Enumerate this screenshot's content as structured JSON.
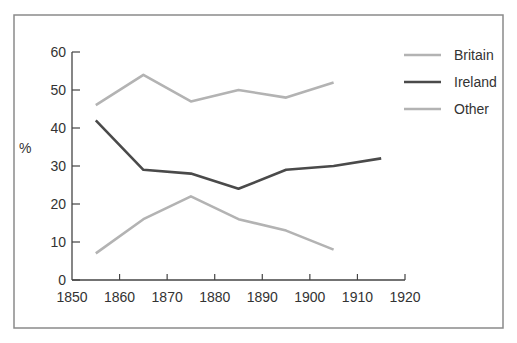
{
  "chart_data": {
    "type": "line",
    "title": "",
    "xlabel": "",
    "ylabel": "%",
    "xlim": [
      1850,
      1920
    ],
    "ylim": [
      0,
      60
    ],
    "x_ticks": [
      1850,
      1860,
      1870,
      1880,
      1890,
      1900,
      1910,
      1920
    ],
    "y_ticks": [
      0,
      10,
      20,
      30,
      40,
      50,
      60
    ],
    "grid": false,
    "legend_position": "upper right",
    "series": [
      {
        "name": "Britain",
        "color": "#b3b3b3",
        "x": [
          1855,
          1865,
          1875,
          1885,
          1895,
          1905
        ],
        "values": [
          46,
          54,
          47,
          50,
          48,
          52
        ]
      },
      {
        "name": "Ireland",
        "color": "#4a4a4a",
        "x": [
          1855,
          1865,
          1875,
          1885,
          1895,
          1905,
          1915
        ],
        "values": [
          42,
          29,
          28,
          24,
          29,
          30,
          32
        ]
      },
      {
        "name": "Other",
        "color": "#b3b3b3",
        "x": [
          1855,
          1865,
          1875,
          1885,
          1895,
          1905
        ],
        "values": [
          7,
          16,
          22,
          16,
          13,
          8
        ]
      }
    ]
  },
  "legend": {
    "items": [
      {
        "label": "Britain",
        "color": "#b3b3b3"
      },
      {
        "label": "Ireland",
        "color": "#4a4a4a"
      },
      {
        "label": "Other",
        "color": "#b3b3b3"
      }
    ]
  },
  "axes": {
    "y_unit_label": "%",
    "frame_color": "#7a7a7a",
    "axis_color": "#444444"
  }
}
